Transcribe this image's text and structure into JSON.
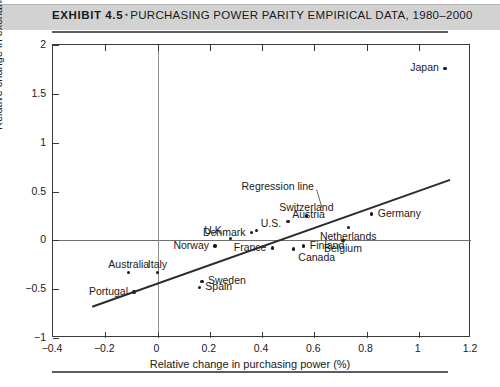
{
  "header": {
    "exhibit_label": "EXHIBIT 4.5",
    "separator": "▪",
    "title": "PURCHASING POWER PARITY EMPIRICAL DATA, 1980–2000"
  },
  "chart_data": {
    "type": "scatter",
    "title": "Purchasing Power Parity Empirical Data, 1980–2000",
    "xlabel": "Relative change in purchasing power (%)",
    "ylabel": "Relative change in exchange rate (%)",
    "xlim": [
      -0.4,
      1.2
    ],
    "ylim": [
      -1,
      2
    ],
    "xticks": [
      -0.4,
      -0.2,
      0,
      0.2,
      0.4,
      0.6,
      0.8,
      1,
      1.2
    ],
    "xticklabels": [
      "−0.4",
      "−0.2",
      "0",
      "0.2",
      "0.4",
      "0.6",
      "0.8",
      "1",
      "1.2"
    ],
    "yticks": [
      -1,
      -0.5,
      0,
      0.5,
      1,
      1.5,
      2
    ],
    "yticklabels": [
      "−1",
      "−0.5",
      "0",
      "0.5",
      "1",
      "1.5",
      "2"
    ],
    "grid": false,
    "legend": false,
    "zero_lines": {
      "horizontal": 0,
      "vertical": 0
    },
    "annotations": [
      {
        "text": "Regression line",
        "x": 0.46,
        "y": 0.55,
        "leader_to_x": 0.63,
        "leader_to_y": 0.33
      }
    ],
    "regression_line": {
      "x_start": -0.25,
      "y_start": -0.68,
      "x_end": 1.12,
      "y_end": 0.62
    },
    "points": [
      {
        "name": "Japan",
        "x": 1.1,
        "y": 1.76,
        "label_pos": "left"
      },
      {
        "name": "Germany",
        "x": 0.82,
        "y": 0.27,
        "label_pos": "right"
      },
      {
        "name": "Switzerland",
        "x": 0.57,
        "y": 0.25,
        "label_pos": "above"
      },
      {
        "name": "Austria",
        "x": 0.5,
        "y": 0.19,
        "label_pos": "above-right"
      },
      {
        "name": "Netherlands",
        "x": 0.73,
        "y": 0.13,
        "label_pos": "below"
      },
      {
        "name": "U.S.",
        "x": 0.38,
        "y": 0.1,
        "label_pos": "above-right"
      },
      {
        "name": "Denmark",
        "x": 0.36,
        "y": 0.08,
        "label_pos": "left"
      },
      {
        "name": "U.K.",
        "x": 0.28,
        "y": 0.02,
        "label_pos": "above-left"
      },
      {
        "name": "Belgium",
        "x": 0.71,
        "y": 0.0,
        "label_pos": "below"
      },
      {
        "name": "Finland",
        "x": 0.56,
        "y": -0.06,
        "label_pos": "right"
      },
      {
        "name": "Canada",
        "x": 0.52,
        "y": -0.09,
        "label_pos": "below-right"
      },
      {
        "name": "France",
        "x": 0.44,
        "y": -0.08,
        "label_pos": "left"
      },
      {
        "name": "Norway",
        "x": 0.22,
        "y": -0.06,
        "label_pos": "left"
      },
      {
        "name": "Australia",
        "x": -0.11,
        "y": -0.33,
        "label_pos": "above"
      },
      {
        "name": "Italy",
        "x": 0.0,
        "y": -0.33,
        "label_pos": "above"
      },
      {
        "name": "Sweden",
        "x": 0.17,
        "y": -0.42,
        "label_pos": "right"
      },
      {
        "name": "Spain",
        "x": 0.16,
        "y": -0.48,
        "label_pos": "right"
      },
      {
        "name": "Portugal",
        "x": -0.09,
        "y": -0.53,
        "label_pos": "left"
      }
    ]
  }
}
